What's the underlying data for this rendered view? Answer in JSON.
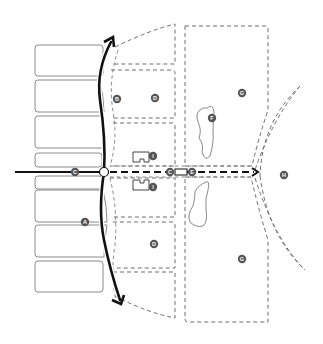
{
  "diagram": {
    "type": "site-plan",
    "colors": {
      "background": "#ffffff",
      "route": "#111111",
      "label_marker": "#555555",
      "building_outline": "#8a8a8a",
      "plot_outline": "#6e6e6e"
    },
    "labels": {
      "A": "A",
      "B": "B",
      "C1": "C",
      "C2": "C",
      "D1": "D",
      "D2": "D",
      "E": "E",
      "F": "F",
      "G1": "G",
      "G2": "G",
      "H": "H",
      "I1": "I",
      "I2": "I"
    },
    "elements": {
      "buildings_left": 8,
      "curved_route": "thick black double-headed curved arrow (north-south)",
      "axis": "solid road from west turning into dashed arrow heading east",
      "node": "white circle at junction",
      "plots": "dashed parcel outlines",
      "ponds": 2,
      "kiosks": 2,
      "arc": "dashed double arc on east side"
    }
  }
}
